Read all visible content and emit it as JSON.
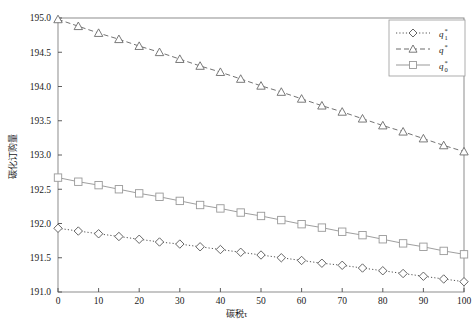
{
  "chart_data": {
    "type": "line",
    "title": "",
    "xlabel": "碳税τ",
    "ylabel": "碳化订购量",
    "xlim": [
      0,
      100
    ],
    "ylim": [
      191.0,
      195.0
    ],
    "grid": false,
    "legend_position": "top-right",
    "x": [
      0,
      5,
      10,
      15,
      20,
      25,
      30,
      35,
      40,
      45,
      50,
      55,
      60,
      65,
      70,
      75,
      80,
      85,
      90,
      95,
      100
    ],
    "xticks": [
      0,
      10,
      20,
      30,
      40,
      50,
      60,
      70,
      80,
      90,
      100
    ],
    "xtick_labels": [
      "0",
      "10",
      "20",
      "30",
      "40",
      "50",
      "60",
      "70",
      "80",
      "90",
      "100"
    ],
    "yticks": [
      191.0,
      191.5,
      192.0,
      192.5,
      193.0,
      193.5,
      194.0,
      194.5,
      195.0
    ],
    "ytick_labels": [
      "191.0",
      "191.5",
      "192.0",
      "192.5",
      "193.0",
      "193.5",
      "194.0",
      "194.5",
      "195.0"
    ],
    "series": [
      {
        "name": "q1star",
        "label": "q",
        "label_sub": "1",
        "label_sup": "*",
        "marker": "diamond",
        "linestyle": "dotted",
        "color": "#555555",
        "values": [
          191.93,
          191.89,
          191.85,
          191.81,
          191.77,
          191.73,
          191.7,
          191.66,
          191.62,
          191.58,
          191.54,
          191.5,
          191.46,
          191.42,
          191.39,
          191.35,
          191.31,
          191.27,
          191.23,
          191.19,
          191.15
        ]
      },
      {
        "name": "qstar",
        "label": "q",
        "label_sub": "",
        "label_sup": "*",
        "marker": "triangle",
        "linestyle": "dashed",
        "color": "#6b6b6b",
        "values": [
          194.98,
          194.88,
          194.78,
          194.69,
          194.59,
          194.5,
          194.4,
          194.3,
          194.21,
          194.11,
          194.01,
          193.92,
          193.82,
          193.72,
          193.63,
          193.53,
          193.43,
          193.34,
          193.24,
          193.14,
          193.05
        ]
      },
      {
        "name": "q0star",
        "label": "q",
        "label_sub": "0",
        "label_sup": "*",
        "marker": "square",
        "linestyle": "solid",
        "color": "#999999",
        "values": [
          192.67,
          192.61,
          192.56,
          192.5,
          192.44,
          192.39,
          192.33,
          192.27,
          192.22,
          192.16,
          192.11,
          192.05,
          191.99,
          191.94,
          191.88,
          191.83,
          191.77,
          191.71,
          191.66,
          191.6,
          191.55
        ]
      }
    ]
  },
  "figure": {
    "caption": "",
    "frame_color": "#808080",
    "background": "#ffffff"
  }
}
